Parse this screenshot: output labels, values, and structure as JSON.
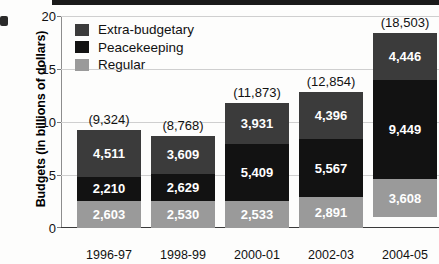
{
  "chart_data": {
    "type": "bar",
    "subtype": "stacked",
    "title": "",
    "xlabel": "Year",
    "ylabel": "Budgets (in billions of dollars)",
    "categories": [
      "1996-97",
      "1998-99",
      "2000-01",
      "2002-03",
      "2004-05"
    ],
    "ylim": [
      0,
      20
    ],
    "yticks": [
      0,
      5,
      10,
      15,
      20
    ],
    "ytick_labels": [
      "0",
      "5",
      "10",
      "15",
      "20"
    ],
    "grid": true,
    "grid_axis": "y",
    "legend_position": "upper-left-inside",
    "value_units": "millions of dollars (segment labels); totals in parentheses",
    "series": [
      {
        "name": "Extra-budgetary",
        "color": "#3b3b3b",
        "values": [
          4511,
          3609,
          3931,
          4396,
          4446
        ],
        "value_labels": [
          "4,511",
          "3,609",
          "3,931",
          "4,396",
          "4,446"
        ]
      },
      {
        "name": "Peacekeeping",
        "color": "#121212",
        "values": [
          2210,
          2629,
          5409,
          5567,
          9449
        ],
        "value_labels": [
          "2,210",
          "2,629",
          "5,409",
          "5,567",
          "9,449"
        ]
      },
      {
        "name": "Regular",
        "color": "#9a9a9a",
        "values": [
          2603,
          2530,
          2533,
          2891,
          3608
        ],
        "value_labels": [
          "2,603",
          "2,530",
          "2,533",
          "2,891",
          "3,608"
        ]
      }
    ],
    "totals": [
      9324,
      8768,
      11873,
      12854,
      18503
    ],
    "total_labels": [
      "(9,324)",
      "(8,768)",
      "(11,873)",
      "(12,854)",
      "(18,503)"
    ]
  },
  "legend": {
    "items": [
      {
        "label": "Extra-budgetary",
        "color": "#3b3b3b"
      },
      {
        "label": "Peacekeeping",
        "color": "#121212"
      },
      {
        "label": "Regular",
        "color": "#9a9a9a"
      }
    ]
  },
  "axes": {
    "y_title": "Budgets (in billions of dollars)",
    "x_title": "Year",
    "y_tick_labels": [
      "20",
      "15",
      "10",
      "5",
      "0"
    ],
    "x_tick_labels": [
      "1996-97",
      "1998-99",
      "2000-01",
      "2002-03",
      "2004-05"
    ]
  }
}
